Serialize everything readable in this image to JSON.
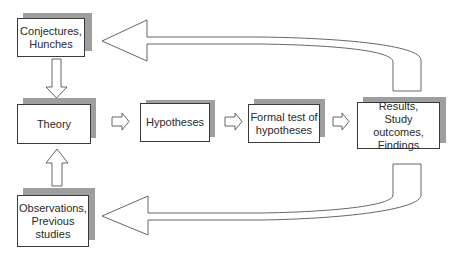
{
  "diagram": {
    "type": "research-cycle-flowchart",
    "nodes": [
      {
        "id": "conjectures",
        "label": "Conjectures,\nHunches"
      },
      {
        "id": "theory",
        "label": "Theory"
      },
      {
        "id": "observations",
        "label": "Observations,\nPrevious\nstudies"
      },
      {
        "id": "hypotheses",
        "label": "Hypotheses"
      },
      {
        "id": "formal_test",
        "label": "Formal test of\nhypotheses"
      },
      {
        "id": "results",
        "label": "Results,\nStudy outcomes,\nFindings"
      }
    ],
    "edges": [
      {
        "from": "conjectures",
        "to": "theory",
        "style": "block-arrow-down"
      },
      {
        "from": "observations",
        "to": "theory",
        "style": "block-arrow-up"
      },
      {
        "from": "theory",
        "to": "hypotheses",
        "style": "block-arrow-right"
      },
      {
        "from": "hypotheses",
        "to": "formal_test",
        "style": "block-arrow-right"
      },
      {
        "from": "formal_test",
        "to": "results",
        "style": "block-arrow-right"
      },
      {
        "from": "results",
        "to": "conjectures",
        "style": "curved-block-arrow-top"
      },
      {
        "from": "results",
        "to": "observations",
        "style": "curved-block-arrow-bottom"
      }
    ],
    "colors": {
      "box_border": "#3a3a3a",
      "box_fill": "#ffffff",
      "shadow": "#9e9e9e",
      "arrow_stroke": "#555555",
      "background": "#ffffff"
    }
  }
}
